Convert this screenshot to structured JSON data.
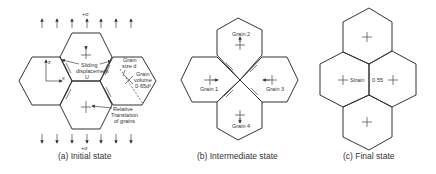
{
  "figure": {
    "panels": [
      {
        "id": "a",
        "caption": "(a) Initial state",
        "stress_top": "+σ",
        "stress_bottom": "+σ",
        "axis_z": "z",
        "axis_x": "x",
        "axis_x_sub": "s",
        "annotations": {
          "sliding_line1": "Sliding",
          "sliding_line2": "displacement",
          "sliding_line3": "U",
          "grain_size_line1": "Grain",
          "grain_size_line2": "size d",
          "grain_volume_line1": "Grain",
          "grain_volume_line2": "volume",
          "grain_volume_line3": "0·65d³",
          "relative_line1": "Relative",
          "relative_line2": "Translation",
          "relative_line3": "of grains"
        }
      },
      {
        "id": "b",
        "caption": "(b) Intermediate state",
        "grains": [
          "Grain 1",
          "Grain 2",
          "Grain 3",
          "Grain 4"
        ]
      },
      {
        "id": "c",
        "caption": "(c) Final state",
        "strain_label": "Strain",
        "strain_value": "0·55"
      }
    ]
  }
}
